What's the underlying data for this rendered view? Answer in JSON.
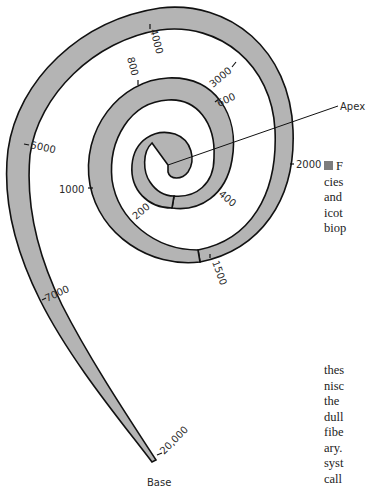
{
  "figure": {
    "labels": {
      "apex": "Apex",
      "base": "Base"
    },
    "frequency_markers": [
      {
        "value": "200"
      },
      {
        "value": "400"
      },
      {
        "value": "600"
      },
      {
        "value": "800"
      },
      {
        "value": "1000"
      },
      {
        "value": "1500"
      },
      {
        "value": "2000"
      },
      {
        "value": "3000"
      },
      {
        "value": "4000"
      },
      {
        "value": "5000"
      },
      {
        "value": "7000"
      },
      {
        "value": "20,000"
      }
    ],
    "colors": {
      "membrane_fill": "#b4b4b4",
      "outline": "#111111",
      "background": "#ffffff"
    }
  },
  "side_text": {
    "caption_lines": [
      "F",
      "cies",
      "and",
      "icot",
      "biop"
    ],
    "body_lines": [
      "thes",
      "nisc",
      "the",
      "dull",
      "fibe",
      "ary.",
      "syst",
      "call"
    ]
  }
}
